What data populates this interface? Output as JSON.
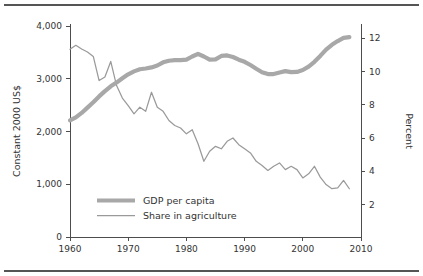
{
  "chart_data": {
    "type": "line",
    "title": "",
    "xlabel": "",
    "ylabel": "Constant 2000 US$",
    "y2label": "Percent",
    "xlim": [
      1960,
      2010
    ],
    "ylim": [
      0,
      4000
    ],
    "y2lim": [
      0,
      12.8
    ],
    "grid": false,
    "legend_position": "inside-bottom-left",
    "x_ticks": [
      "1960",
      "1970",
      "1980",
      "1990",
      "2000",
      "2010"
    ],
    "x_tick_values": [
      1960,
      1970,
      1980,
      1990,
      2000,
      2010
    ],
    "y_ticks": [
      "0",
      "1,000",
      "2,000",
      "3,000",
      "4,000"
    ],
    "y_tick_values": [
      0,
      1000,
      2000,
      3000,
      4000
    ],
    "y2_ticks": [
      "2",
      "4",
      "6",
      "8",
      "10",
      "12"
    ],
    "y2_tick_values": [
      2,
      4,
      6,
      8,
      10,
      12
    ],
    "x": [
      1960,
      1961,
      1962,
      1963,
      1964,
      1965,
      1966,
      1967,
      1968,
      1969,
      1970,
      1971,
      1972,
      1973,
      1974,
      1975,
      1976,
      1977,
      1978,
      1979,
      1980,
      1981,
      1982,
      1983,
      1984,
      1985,
      1986,
      1987,
      1988,
      1989,
      1990,
      1991,
      1992,
      1993,
      1994,
      1995,
      1996,
      1997,
      1998,
      1999,
      2000,
      2001,
      2002,
      2003,
      2004,
      2005,
      2006,
      2007,
      2008
    ],
    "series": [
      {
        "name": "GDP per capita",
        "axis": "left",
        "units": "Constant 2000 US$",
        "color": "#a8a8a8",
        "linewidth": "thick",
        "values": [
          2190,
          2245,
          2330,
          2430,
          2530,
          2640,
          2740,
          2830,
          2900,
          2980,
          3055,
          3110,
          3150,
          3165,
          3185,
          3220,
          3280,
          3310,
          3320,
          3320,
          3330,
          3390,
          3440,
          3390,
          3330,
          3335,
          3400,
          3410,
          3380,
          3330,
          3290,
          3230,
          3160,
          3095,
          3060,
          3060,
          3090,
          3115,
          3095,
          3100,
          3135,
          3200,
          3290,
          3400,
          3520,
          3610,
          3680,
          3740,
          3755
        ]
      },
      {
        "name": "Share in agriculture",
        "axis": "right",
        "units": "Percent",
        "color": "#9a9a9a",
        "linewidth": "thin",
        "values": [
          11.28,
          11.52,
          11.3,
          11.12,
          10.85,
          9.4,
          9.62,
          10.55,
          9.1,
          8.35,
          7.9,
          7.4,
          7.8,
          7.55,
          8.7,
          7.8,
          7.55,
          7.0,
          6.7,
          6.55,
          6.2,
          6.45,
          5.6,
          4.55,
          5.15,
          5.45,
          5.3,
          5.75,
          5.95,
          5.55,
          5.3,
          5.05,
          4.55,
          4.3,
          4.0,
          4.25,
          4.45,
          4.05,
          4.25,
          4.05,
          3.55,
          3.8,
          4.25,
          3.6,
          3.15,
          2.9,
          2.95,
          3.4,
          2.9
        ]
      }
    ],
    "legend": [
      {
        "label": "GDP per capita",
        "style": "thick-gray"
      },
      {
        "label": "Share in agriculture",
        "style": "thin-gray"
      }
    ]
  }
}
